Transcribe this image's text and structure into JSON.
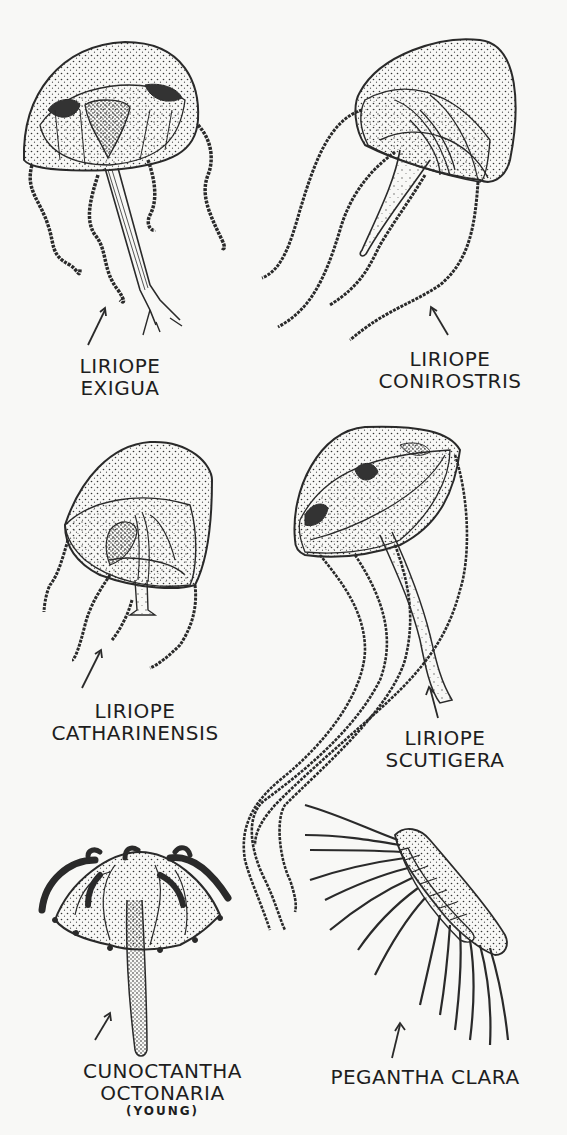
{
  "figure": {
    "type": "scientific-illustration-plate",
    "ink_color": "#2a2a2a",
    "paper_color": "#f8f8f6",
    "specimens": [
      {
        "id": "liriope-exigua",
        "label_lines": [
          "LIRIOPE",
          "EXIGUA"
        ],
        "position": "top-left"
      },
      {
        "id": "liriope-conirostris",
        "label_lines": [
          "LIRIOPE",
          "CONIROSTRIS"
        ],
        "position": "top-right"
      },
      {
        "id": "liriope-catharinensis",
        "label_lines": [
          "LIRIOPE",
          "CATHARINENSIS"
        ],
        "position": "middle-left"
      },
      {
        "id": "liriope-scutigera",
        "label_lines": [
          "LIRIOPE",
          "SCUTIGERA"
        ],
        "position": "middle-right"
      },
      {
        "id": "cunoctantha-octonaria",
        "label_lines": [
          "CUNOCTANTHA",
          "OCTONARIA"
        ],
        "note": "(YOUNG)",
        "position": "bottom-left"
      },
      {
        "id": "pegantha-clara",
        "label_lines": [
          "PEGANTHA CLARA"
        ],
        "position": "bottom-right"
      }
    ]
  }
}
